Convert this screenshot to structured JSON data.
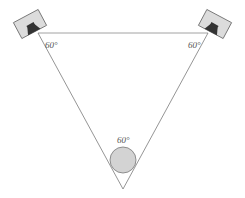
{
  "diagram": {
    "angles": {
      "left": "60°",
      "right": "60°",
      "listener": "60°"
    },
    "colors": {
      "line": "#7a7a7a",
      "speaker_box": "#d9d9d9",
      "speaker_driver": "#3a3a3a",
      "listener": "#d0d0d0"
    }
  }
}
